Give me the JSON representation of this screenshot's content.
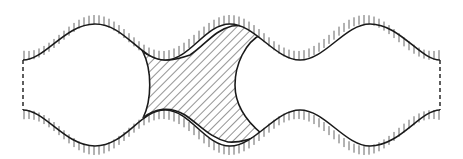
{
  "diagram": {
    "colors": {
      "stroke": "#1a1a1a",
      "hatch": "#2a2a2a",
      "wall_ticks": "#555555",
      "background": "#ffffff"
    },
    "elements": [
      {
        "id": "top-wall",
        "type": "wavy-wall"
      },
      {
        "id": "bottom-wall",
        "type": "wavy-wall"
      },
      {
        "id": "left-boundary",
        "type": "dashed-line"
      },
      {
        "id": "right-boundary",
        "type": "dashed-line"
      },
      {
        "id": "hatched-region",
        "type": "hatched-area"
      },
      {
        "id": "left-bubble",
        "type": "bubble"
      },
      {
        "id": "right-bubble",
        "type": "bubble"
      }
    ]
  }
}
